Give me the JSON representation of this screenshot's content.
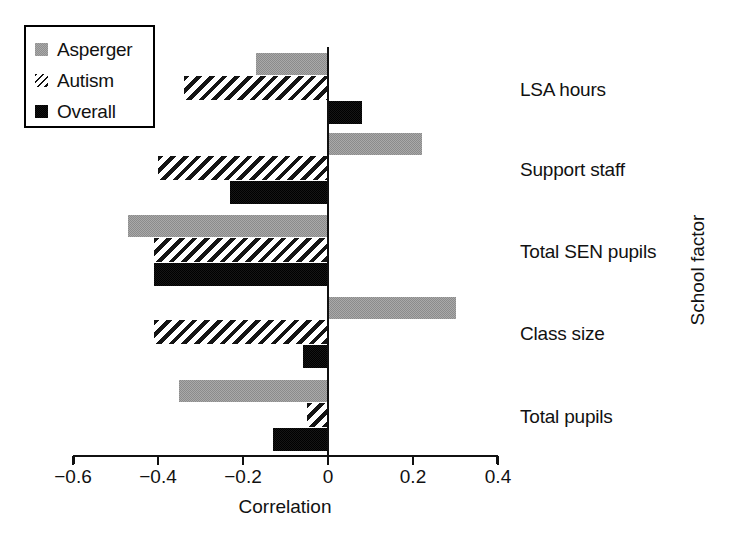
{
  "chart_data": {
    "type": "bar",
    "orientation": "horizontal",
    "title": "",
    "xlabel": "Correlation",
    "ylabel": "School factor",
    "categories": [
      "LSA hours",
      "Support staff",
      "Total SEN pupils",
      "Class size",
      "Total pupils"
    ],
    "series": [
      {
        "name": "Asperger",
        "color": "#a9a9a9",
        "fill": "light-gray-dither",
        "values": [
          -0.17,
          0.22,
          -0.47,
          0.3,
          -0.35
        ]
      },
      {
        "name": "Autism",
        "color": "#141414",
        "fill": "diagonal-hatch",
        "values": [
          -0.34,
          -0.4,
          -0.41,
          -0.41,
          -0.05
        ]
      },
      {
        "name": "Overall",
        "color": "#151515",
        "fill": "solid-black",
        "values": [
          0.08,
          -0.23,
          -0.41,
          -0.06,
          -0.13
        ]
      }
    ],
    "xlim": [
      -0.6,
      0.4
    ],
    "xticks": [
      -0.6,
      -0.4,
      -0.2,
      0,
      0.2,
      0.4
    ],
    "xticklabels": [
      "−0.6",
      "−0.4",
      "−0.2",
      "0",
      "0.2",
      "0.4"
    ],
    "grid": false,
    "legend_position": "top-left",
    "zero_reference_line": true
  },
  "legend": {
    "items": [
      {
        "label": "Asperger",
        "swatch": "light-gray-square-icon"
      },
      {
        "label": "Autism",
        "swatch": "hatched-square-icon"
      },
      {
        "label": "Overall",
        "swatch": "black-square-icon"
      }
    ]
  },
  "axes": {
    "x_title": "Correlation",
    "y_title": "School factor"
  }
}
